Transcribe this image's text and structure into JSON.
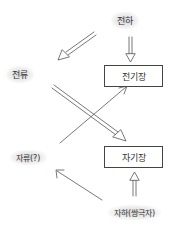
{
  "diagram": {
    "nodes": {
      "charge": "전하",
      "current": "전류",
      "electric_field": "전기장",
      "magnetic_field": "자기장",
      "magnetic_current": "자류(?)",
      "magnetic_charge": "자하(쌍극자)"
    },
    "edges": [
      {
        "from": "charge",
        "to": "electric_field",
        "style": "double"
      },
      {
        "from": "charge",
        "to": "current",
        "style": "double"
      },
      {
        "from": "current",
        "to": "magnetic_field",
        "style": "double"
      },
      {
        "from": "magnetic_current",
        "to": "electric_field",
        "style": "single"
      },
      {
        "from": "magnetic_charge",
        "to": "magnetic_field",
        "style": "double"
      },
      {
        "from": "magnetic_charge",
        "to": "magnetic_current",
        "style": "single"
      }
    ]
  }
}
